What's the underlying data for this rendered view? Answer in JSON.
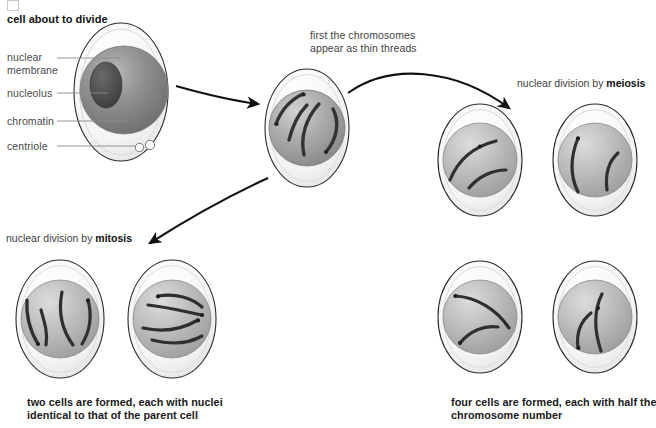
{
  "title": "cell about to divide",
  "leader_labels": [
    {
      "id": "nuclear-membrane",
      "text": "nuclear\nmembrane"
    },
    {
      "id": "nucleolus",
      "text": "nucleolus"
    },
    {
      "id": "chromatin",
      "text": "chromatin"
    },
    {
      "id": "centriole",
      "text": "centriole"
    }
  ],
  "notes": {
    "first_threads": "first the chromosomes\nappear as thin threads",
    "meiosis_prefix": "nuclear division by ",
    "meiosis_term": "meiosis",
    "mitosis_prefix": "nuclear division by ",
    "mitosis_term": "mitosis"
  },
  "captions": {
    "mitosis": "two cells are formed, each with nuclei\nidentical to that of the parent cell",
    "meiosis": "four cells are formed, each with half the\nchromosome number"
  },
  "cells": [
    {
      "id": "parent-cell",
      "name": "cell about to divide",
      "cx": 121,
      "cy": 92,
      "rx": 47,
      "ry": 69,
      "nucleus": {
        "cx": 124,
        "cy": 90,
        "r": 44
      },
      "nucleolus": {
        "cx": 106,
        "cy": 85,
        "rx": 16,
        "ry": 23
      },
      "centrioles": 2,
      "chromosome_count": 0
    },
    {
      "id": "threads-cell",
      "name": "cell with thin chromosome threads",
      "cx": 307,
      "cy": 128,
      "rx": 42,
      "ry": 59,
      "nucleus": {
        "cx": 307,
        "cy": 128,
        "r": 38
      },
      "chromosome_count": 4
    },
    {
      "id": "meiosis-cell-1",
      "name": "meiosis daughter cell top-left",
      "cx": 480,
      "cy": 160,
      "rx": 42,
      "ry": 56,
      "nucleus": {
        "cx": 480,
        "cy": 160,
        "r": 37
      },
      "chromosome_count": 2
    },
    {
      "id": "meiosis-cell-2",
      "name": "meiosis daughter cell top-right",
      "cx": 595,
      "cy": 160,
      "rx": 42,
      "ry": 56,
      "nucleus": {
        "cx": 595,
        "cy": 160,
        "r": 37
      },
      "chromosome_count": 2
    },
    {
      "id": "meiosis-cell-3",
      "name": "meiosis daughter cell bottom-left",
      "cx": 480,
      "cy": 317,
      "rx": 42,
      "ry": 56,
      "nucleus": {
        "cx": 480,
        "cy": 317,
        "r": 37
      },
      "chromosome_count": 2
    },
    {
      "id": "meiosis-cell-4",
      "name": "meiosis daughter cell bottom-right",
      "cx": 595,
      "cy": 317,
      "rx": 42,
      "ry": 56,
      "nucleus": {
        "cx": 595,
        "cy": 317,
        "r": 37
      },
      "chromosome_count": 2
    },
    {
      "id": "mitosis-cell-1",
      "name": "mitosis daughter cell left",
      "cx": 60,
      "cy": 319,
      "rx": 44,
      "ry": 59,
      "nucleus": {
        "cx": 60,
        "cy": 319,
        "r": 39
      },
      "chromosome_count": 4
    },
    {
      "id": "mitosis-cell-2",
      "name": "mitosis daughter cell right",
      "cx": 172,
      "cy": 319,
      "rx": 44,
      "ry": 59,
      "nucleus": {
        "cx": 172,
        "cy": 319,
        "r": 39
      },
      "chromosome_count": 4
    }
  ],
  "arrows": [
    {
      "id": "arrow-parent-to-threads",
      "label": "arrow from parent cell to thread-stage cell"
    },
    {
      "id": "arrow-threads-to-meiosis",
      "label": "arrow from thread-stage cell to meiosis cells"
    },
    {
      "id": "arrow-threads-to-mitosis",
      "label": "arrow from thread-stage cell to mitosis cells"
    }
  ],
  "colors": {
    "cytoplasm": "#f2f2f2",
    "cytoplasm_edge": "#2b2b2b",
    "nucleus_dark": "#6e6e6e",
    "nucleus_mid": "#9a9a9a",
    "nucleus_light": "#c9c9c9",
    "nucleolus": "#4a4a4a",
    "chromosome": "#3a3a3a",
    "arrow": "#111111",
    "leader_line": "#6e6e6e",
    "label_text": "#4a4a4a",
    "caption_text": "#1a1a1a"
  }
}
